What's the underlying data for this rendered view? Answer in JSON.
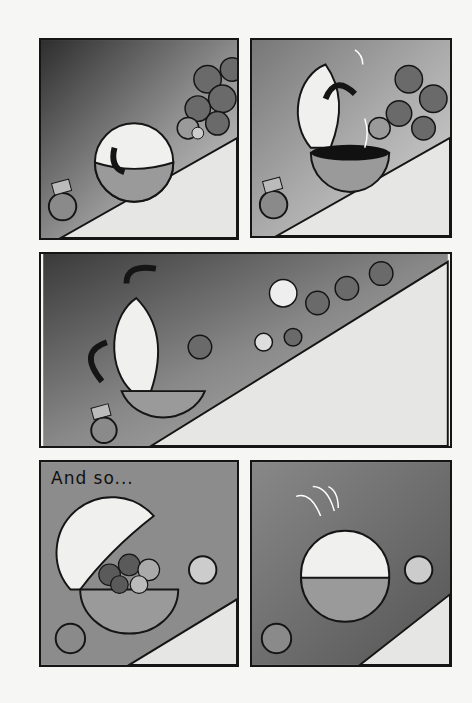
{
  "page": {
    "type": "comic-page",
    "panel_count": 5
  },
  "panels": [
    {
      "id": "p1",
      "description": "Robot sphere rolling toward crowd of striped-hat dogs on slope; Chief watches from lower left",
      "chief_hat_label": "chief"
    },
    {
      "id": "p2",
      "description": "Sphere top pops open with motion lines; dark interior visible",
      "chief_hat_label": "chief"
    },
    {
      "id": "p3",
      "description": "Dogs tumble down slope into the open sphere",
      "chief_hat_label": "chief"
    },
    {
      "id": "p4",
      "caption": "And so...",
      "description": "Sphere filled with dogs, one dog waves",
      "chief_hat_label": "chief"
    },
    {
      "id": "p5",
      "description": "Sphere closed, bouncing with motion arcs; dog stands to the right",
      "chief_hat_label": "chief"
    }
  ],
  "colors": {
    "ink": "#151515",
    "bg_dark": "#3a3a3a",
    "bg_mid": "#8a8a8a",
    "slope": "#e4e4e2",
    "sphere_light": "#f2f2f0",
    "sphere_half": "#9a9a9a"
  }
}
